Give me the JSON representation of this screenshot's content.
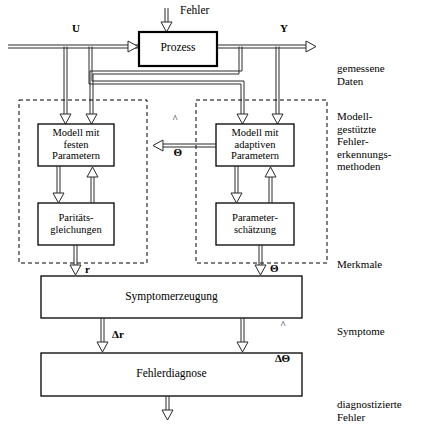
{
  "figure": {
    "type": "block-diagram",
    "colors": {
      "line": "#000000",
      "background": "#ffffff",
      "dashed": "#000000"
    }
  },
  "signals": {
    "fehler_in": "Fehler",
    "u": "U",
    "y": "Y",
    "theta_hat": "Θ",
    "residual": "r",
    "theta": "Θ",
    "delta_r": "Δr",
    "delta_theta": "ΔΘ"
  },
  "blocks": {
    "prozess": "Prozess",
    "modell_fest": [
      "Modell mit",
      "festen",
      "Parametern"
    ],
    "modell_adaptiv": [
      "Modell mit",
      "adaptiven",
      "Parametern"
    ],
    "paritaet": [
      "Paritäts-",
      "gleichungen"
    ],
    "parameterschaetzung": [
      "Parameter-",
      "schätzung"
    ],
    "symptomerzeugung": "Symptomerzeugung",
    "fehlerdiagnose": "Fehlerdiagnose"
  },
  "side_labels": {
    "gemessene_daten": [
      "gemessene",
      "Daten"
    ],
    "methoden": [
      "Modell-",
      "gestützte",
      "Fehler-",
      "erkennungs-",
      "methoden"
    ],
    "merkmale": [
      "Merkmale"
    ],
    "symptome": [
      "Symptome"
    ],
    "diagnostizierte_fehler": [
      "diagnostizierte",
      "Fehler"
    ]
  },
  "side_labels_text": {
    "gemessene_daten": "gemessene\nDaten",
    "methoden": "Modell-\ngestützte\nFehler-\nerkennungs-\nmethoden",
    "merkmale": "Merkmale",
    "symptome": "Symptome",
    "diagnostizierte_fehler": "diagnostizierte\nFehler"
  },
  "blocks_text": {
    "prozess": "Prozess",
    "modell_fest": "Modell mit\nfesten\nParametern",
    "modell_adaptiv": "Modell mit\nadaptiven\nParametern",
    "paritaet": "Paritäts-\ngleichungen",
    "parameterschaetzung": "Parameter-\nschätzung",
    "symptomerzeugung": "Symptomerzeugung",
    "fehlerdiagnose": "Fehlerdiagnose"
  },
  "dashed_groups": {
    "left": "model-based-fixed-parameters-group",
    "right": "model-based-adaptive-parameters-group"
  }
}
